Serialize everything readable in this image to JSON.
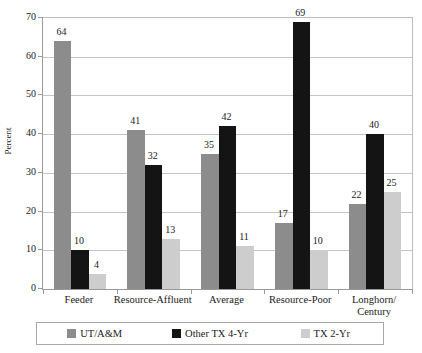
{
  "chart_data": {
    "type": "bar",
    "title": "",
    "xlabel": "",
    "ylabel": "Percent",
    "ylim": [
      0,
      70
    ],
    "yticks": [
      0,
      10,
      20,
      30,
      40,
      50,
      60,
      70
    ],
    "grid": true,
    "legend_position": "bottom",
    "categories": [
      "Feeder",
      "Resource-Affluent",
      "Average",
      "Resource-Poor",
      "Longhorn/\nCentury"
    ],
    "category_lines": [
      [
        "Feeder"
      ],
      [
        "Resource-Affluent"
      ],
      [
        "Average"
      ],
      [
        "Resource-Poor"
      ],
      [
        "Longhorn/",
        "Century"
      ]
    ],
    "series": [
      {
        "name": "UT/A&M",
        "color": "#8c8c8c",
        "values": [
          64,
          41,
          35,
          17,
          22
        ]
      },
      {
        "name": "Other TX 4-Yr",
        "color": "#141414",
        "values": [
          10,
          32,
          42,
          69,
          40
        ]
      },
      {
        "name": "TX 2-Yr",
        "color": "#cdcdcd",
        "values": [
          4,
          13,
          11,
          10,
          25
        ]
      }
    ]
  },
  "axis": {
    "y_title": "Percent",
    "y_tick_labels": [
      "70",
      "60",
      "50",
      "40",
      "30",
      "20",
      "10",
      "0"
    ]
  },
  "legend": {
    "entries": [
      {
        "label": "UT/A&M",
        "swatch": "legend-swatch-ut-am"
      },
      {
        "label": "Other TX 4-Yr",
        "swatch": "legend-swatch-other-tx-4yr"
      },
      {
        "label": "TX 2-Yr",
        "swatch": "legend-swatch-tx-2yr"
      }
    ]
  },
  "top_strip": {
    "text": ""
  }
}
